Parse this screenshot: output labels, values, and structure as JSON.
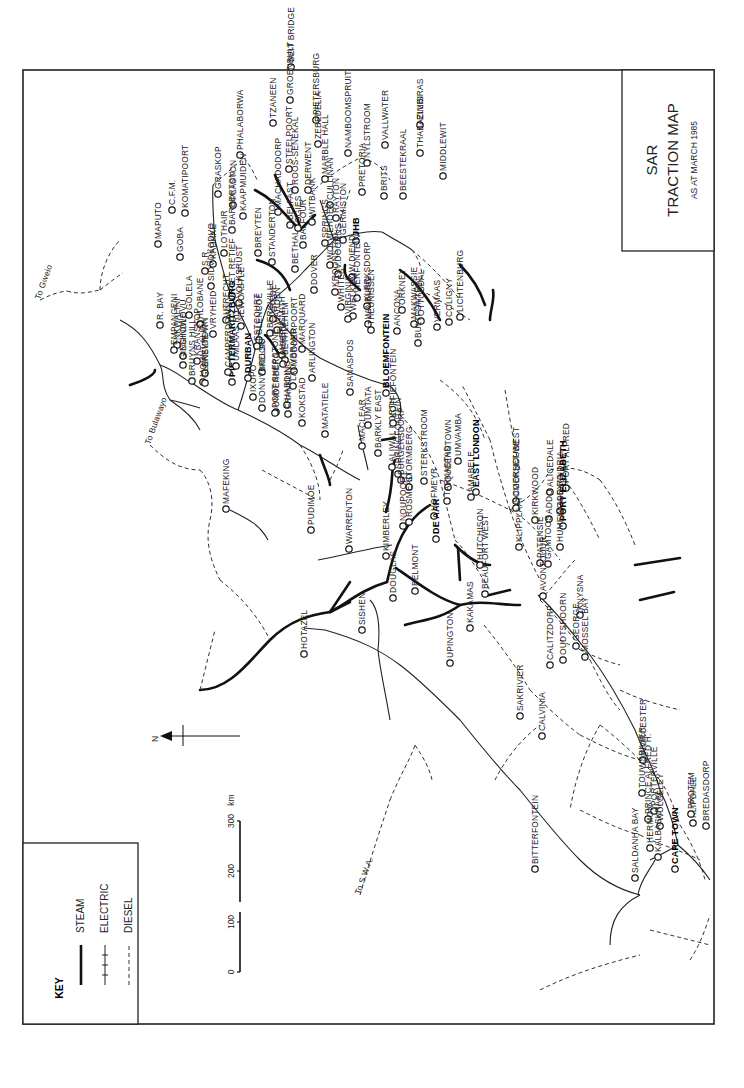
{
  "title": {
    "line1": "SAR",
    "line2": "TRACTION MAP",
    "line3": "AS AT MARCH 1985"
  },
  "key": {
    "heading": "KEY",
    "items": [
      {
        "type": "steam",
        "label": "STEAM"
      },
      {
        "type": "electric",
        "label": "ELECTRIC"
      },
      {
        "type": "diesel",
        "label": "DIESEL"
      }
    ]
  },
  "scale_bar": {
    "ticks": [
      "0",
      "100",
      "200",
      "300"
    ],
    "unit": "km"
  },
  "north_arrow": {
    "label": "N"
  },
  "external_links": [
    {
      "label": "To Gweio",
      "x": 40,
      "y": 300
    },
    {
      "label": "To Bulawayo",
      "x": 150,
      "y": 445
    },
    {
      "label": "To S.W.A.",
      "x": 360,
      "y": 895
    }
  ],
  "stations": [
    {
      "name": "BEIT BRIDGE",
      "x": 67,
      "y": 291
    },
    {
      "name": "GROENBULT",
      "x": 100,
      "y": 290
    },
    {
      "name": "TZANEEN",
      "x": 123,
      "y": 273
    },
    {
      "name": "PHALABORWA",
      "x": 155,
      "y": 240
    },
    {
      "name": "PIETERSBURG",
      "x": 120,
      "y": 316
    },
    {
      "name": "ZEBEDELIA",
      "x": 144,
      "y": 318
    },
    {
      "name": "NAMBOOMSPRUIT",
      "x": 153,
      "y": 348
    },
    {
      "name": "MARBLE HALL",
      "x": 179,
      "y": 325
    },
    {
      "name": "STEELPOORT",
      "x": 169,
      "y": 289
    },
    {
      "name": "ROOS-SENEKAL",
      "x": 190,
      "y": 295
    },
    {
      "name": "VALLWATER",
      "x": 145,
      "y": 385
    },
    {
      "name": "NYLSTROOM",
      "x": 163,
      "y": 367
    },
    {
      "name": "ELLISRAS",
      "x": 125,
      "y": 420
    },
    {
      "name": "THABAZIMBI",
      "x": 153,
      "y": 420
    },
    {
      "name": "MIDDLEWIT",
      "x": 176,
      "y": 443
    },
    {
      "name": "BEESTEKRAAL",
      "x": 196,
      "y": 403
    },
    {
      "name": "BRITS",
      "x": 196,
      "y": 384
    },
    {
      "name": "PRETORIA",
      "x": 192,
      "y": 362
    },
    {
      "name": "CULLINAN",
      "x": 205,
      "y": 330
    },
    {
      "name": "RAYTON",
      "x": 218,
      "y": 336
    },
    {
      "name": "WITBANK",
      "x": 222,
      "y": 312
    },
    {
      "name": "DERWENT",
      "x": 190,
      "y": 308
    },
    {
      "name": "BELFAST",
      "x": 225,
      "y": 290
    },
    {
      "name": "MACHADODORP",
      "x": 212,
      "y": 278
    },
    {
      "name": "GRASKOP",
      "x": 194,
      "y": 218
    },
    {
      "name": "PLASTON",
      "x": 205,
      "y": 233
    },
    {
      "name": "KAAPMUIDEN",
      "x": 216,
      "y": 243
    },
    {
      "name": "KOMATIPOORT",
      "x": 213,
      "y": 185
    },
    {
      "name": "C.F.M.",
      "x": 210,
      "y": 172
    },
    {
      "name": "BARBERTON",
      "x": 230,
      "y": 232
    },
    {
      "name": "MAPUTO",
      "x": 244,
      "y": 158
    },
    {
      "name": "GOBA",
      "x": 257,
      "y": 180
    },
    {
      "name": "LOTHAIR",
      "x": 253,
      "y": 224
    },
    {
      "name": "KADAKE",
      "x": 264,
      "y": 213
    },
    {
      "name": "S.R.",
      "x": 271,
      "y": 205
    },
    {
      "name": "SIDVOKODVO",
      "x": 286,
      "y": 211
    },
    {
      "name": "PIET RETIEF",
      "x": 296,
      "y": 232
    },
    {
      "name": "GOLELA",
      "x": 315,
      "y": 189
    },
    {
      "name": "BREYTEN",
      "x": 253,
      "y": 258
    },
    {
      "name": "BETHAL",
      "x": 269,
      "y": 295
    },
    {
      "name": "OGIES",
      "x": 228,
      "y": 298
    },
    {
      "name": "SPRINGS",
      "x": 243,
      "y": 325
    },
    {
      "name": "GERMISTON",
      "x": 240,
      "y": 343
    },
    {
      "name": "JHB",
      "x": 241,
      "y": 356
    },
    {
      "name": "BALFOUR",
      "x": 245,
      "y": 303
    },
    {
      "name": "STANDERTON",
      "x": 262,
      "y": 272
    },
    {
      "name": "VOLKSRUST",
      "x": 303,
      "y": 239
    },
    {
      "name": "UTRECHT",
      "x": 320,
      "y": 226
    },
    {
      "name": "HLOBANE",
      "x": 324,
      "y": 200
    },
    {
      "name": "VRYHEID",
      "x": 334,
      "y": 213
    },
    {
      "name": "NEWCASTLE",
      "x": 326,
      "y": 241
    },
    {
      "name": "GLENCOE",
      "x": 340,
      "y": 259
    },
    {
      "name": "VREDE",
      "x": 319,
      "y": 273
    },
    {
      "name": "WARDEN",
      "x": 330,
      "y": 277
    },
    {
      "name": "HARRISMITH",
      "x": 355,
      "y": 282
    },
    {
      "name": "BETHLEHEM",
      "x": 360,
      "y": 285
    },
    {
      "name": "ARLINGTON",
      "x": 378,
      "y": 312
    },
    {
      "name": "WOLWEHOEK",
      "x": 265,
      "y": 330
    },
    {
      "name": "V.DOORNS",
      "x": 274,
      "y": 338
    },
    {
      "name": "W.DIEND",
      "x": 277,
      "y": 352
    },
    {
      "name": "VIERFONTEIN",
      "x": 298,
      "y": 357
    },
    {
      "name": "KLERKSDORP",
      "x": 306,
      "y": 367
    },
    {
      "name": "DOVER",
      "x": 290,
      "y": 314
    },
    {
      "name": "KROONSTAD",
      "x": 292,
      "y": 335
    },
    {
      "name": "WHITES",
      "x": 307,
      "y": 341
    },
    {
      "name": "WELKOM",
      "x": 316,
      "y": 353
    },
    {
      "name": "VIRGINIA",
      "x": 319,
      "y": 348
    },
    {
      "name": "WINBURG",
      "x": 324,
      "y": 368
    },
    {
      "name": "THEUNISSEN",
      "x": 330,
      "y": 371
    },
    {
      "name": "ANCONA",
      "x": 331,
      "y": 397
    },
    {
      "name": "ORKNEY",
      "x": 310,
      "y": 402
    },
    {
      "name": "OTTOSDAL",
      "x": 321,
      "y": 421
    },
    {
      "name": "VERMAAS",
      "x": 327,
      "y": 437
    },
    {
      "name": "COLIGNY",
      "x": 322,
      "y": 449
    },
    {
      "name": "LICHTENBURG",
      "x": 317,
      "y": 460
    },
    {
      "name": "MAKWASSIE",
      "x": 324,
      "y": 414
    },
    {
      "name": "MARQUARD",
      "x": 349,
      "y": 302
    },
    {
      "name": "SANASPOS",
      "x": 392,
      "y": 350
    },
    {
      "name": "MODDERPOORT",
      "x": 371,
      "y": 294
    },
    {
      "name": "LADYBRAND",
      "x": 386,
      "y": 293
    },
    {
      "name": "MASERU",
      "x": 364,
      "y": 283
    },
    {
      "name": "BERGVILLE",
      "x": 333,
      "y": 270
    },
    {
      "name": "ESTCOURT",
      "x": 346,
      "y": 257
    },
    {
      "name": "MOUNT ALIDA",
      "x": 382,
      "y": 203
    },
    {
      "name": "GREYTOWN",
      "x": 373,
      "y": 205
    },
    {
      "name": "KRANSKOP",
      "x": 361,
      "y": 197
    },
    {
      "name": "ESHOWE",
      "x": 356,
      "y": 183
    },
    {
      "name": "NKWALINI",
      "x": 345,
      "y": 177
    },
    {
      "name": "R. BAY",
      "x": 325,
      "y": 160
    },
    {
      "name": "EMPANGENI",
      "x": 350,
      "y": 174
    },
    {
      "name": "GINGINDLOVU",
      "x": 365,
      "y": 183
    },
    {
      "name": "BRUYNS HILL",
      "x": 381,
      "y": 192
    },
    {
      "name": "GLENSIDE",
      "x": 383,
      "y": 205
    },
    {
      "name": "PIETERMARITZBURG",
      "x": 382,
      "y": 232
    },
    {
      "name": "CAMPERDOWN",
      "x": 372,
      "y": 228
    },
    {
      "name": "UMLAAS RD.",
      "x": 366,
      "y": 236
    },
    {
      "name": "DURBAN",
      "x": 378,
      "y": 248
    },
    {
      "name": "KELSO",
      "x": 372,
      "y": 262
    },
    {
      "name": "IXOPO",
      "x": 397,
      "y": 253
    },
    {
      "name": "DONNYBROOK",
      "x": 408,
      "y": 262
    },
    {
      "name": "UNDERBERG",
      "x": 412,
      "y": 276
    },
    {
      "name": "HARDING",
      "x": 405,
      "y": 287
    },
    {
      "name": "PORT SHEPSTONE",
      "x": 413,
      "y": 275
    },
    {
      "name": "FRANKLIN",
      "x": 414,
      "y": 288
    },
    {
      "name": "KOKSTAD",
      "x": 423,
      "y": 302
    },
    {
      "name": "MATATIELE",
      "x": 434,
      "y": 325
    },
    {
      "name": "UMTATA",
      "x": 425,
      "y": 368
    },
    {
      "name": "MACLEAR",
      "x": 446,
      "y": 362
    },
    {
      "name": "BARKLY EAST",
      "x": 453,
      "y": 378
    },
    {
      "name": "ALIWAL NORTH",
      "x": 467,
      "y": 392
    },
    {
      "name": "SPRINGFONTEIN",
      "x": 474,
      "y": 398
    },
    {
      "name": "BLOEMFONTEIN",
      "x": 393,
      "y": 386
    },
    {
      "name": "KOFFIEFONTEIN",
      "x": 423,
      "y": 393
    },
    {
      "name": "BULTFONTEIN",
      "x": 343,
      "y": 418
    },
    {
      "name": "BURGERSDORP",
      "x": 480,
      "y": 401
    },
    {
      "name": "STORMBERG",
      "x": 487,
      "y": 409
    },
    {
      "name": "STERKSTROOM",
      "x": 481,
      "y": 424
    },
    {
      "name": "QUEENSTOWN",
      "x": 487,
      "y": 448
    },
    {
      "name": "UMVAMBA",
      "x": 461,
      "y": 458
    },
    {
      "name": "AMABELE",
      "x": 497,
      "y": 471
    },
    {
      "name": "EAST LONDON",
      "x": 492,
      "y": 476
    },
    {
      "name": "TARKASTAD",
      "x": 501,
      "y": 447
    },
    {
      "name": "HOFMEYR",
      "x": 516,
      "y": 434
    },
    {
      "name": "NOUPOORT",
      "x": 526,
      "y": 403
    },
    {
      "name": "ROSMEAD",
      "x": 522,
      "y": 409
    },
    {
      "name": "DE AAR",
      "x": 539,
      "y": 436
    },
    {
      "name": "COOKHOUSE",
      "x": 501,
      "y": 516
    },
    {
      "name": "SOMERSET WEST",
      "x": 508,
      "y": 516
    },
    {
      "name": "ALICEDALE",
      "x": 492,
      "y": 550
    },
    {
      "name": "PORT ALFRED",
      "x": 488,
      "y": 566
    },
    {
      "name": "KIRKWOOD",
      "x": 520,
      "y": 535
    },
    {
      "name": "ADDO",
      "x": 519,
      "y": 549
    },
    {
      "name": "ALEXANDRIA",
      "x": 511,
      "y": 560
    },
    {
      "name": "PORT ELIZABETH",
      "x": 526,
      "y": 563
    },
    {
      "name": "PATENSIE",
      "x": 563,
      "y": 540
    },
    {
      "name": "GAMTOOS",
      "x": 564,
      "y": 548
    },
    {
      "name": "HUMEWOOD RD",
      "x": 547,
      "y": 560
    },
    {
      "name": "KLIPPLAAT",
      "x": 547,
      "y": 519
    },
    {
      "name": "AVONTOUUR",
      "x": 596,
      "y": 543
    },
    {
      "name": "KNYSNA",
      "x": 615,
      "y": 580
    },
    {
      "name": "GEORGE",
      "x": 646,
      "y": 576
    },
    {
      "name": "MOSSEL BAY",
      "x": 657,
      "y": 585
    },
    {
      "name": "OUDTSHOORN",
      "x": 660,
      "y": 563
    },
    {
      "name": "CALITZDORP",
      "x": 665,
      "y": 550
    },
    {
      "name": "BEAUFORT WEST",
      "x": 594,
      "y": 485
    },
    {
      "name": "HUTCHISON",
      "x": 565,
      "y": 480
    },
    {
      "name": "KIMBERLEY",
      "x": 556,
      "y": 386
    },
    {
      "name": "WARRENTON",
      "x": 549,
      "y": 349
    },
    {
      "name": "PUDIMOE",
      "x": 530,
      "y": 311
    },
    {
      "name": "MAFEKING",
      "x": 509,
      "y": 226
    },
    {
      "name": "BELMONT",
      "x": 591,
      "y": 415
    },
    {
      "name": "DOUGLAS",
      "x": 598,
      "y": 393
    },
    {
      "name": "SISHEN",
      "x": 630,
      "y": 362
    },
    {
      "name": "HOTAZEL",
      "x": 654,
      "y": 304
    },
    {
      "name": "UPINGTON",
      "x": 663,
      "y": 450
    },
    {
      "name": "KAKAMAS",
      "x": 628,
      "y": 470
    },
    {
      "name": "SAKRIVIER",
      "x": 716,
      "y": 520
    },
    {
      "name": "CALVINIA",
      "x": 736,
      "y": 542
    },
    {
      "name": "BITTERFONTEIN",
      "x": 869,
      "y": 535
    },
    {
      "name": "WORCESTER",
      "x": 760,
      "y": 643
    },
    {
      "name": "TOUWSRIVIER",
      "x": 793,
      "y": 642
    },
    {
      "name": "PRINCE ALFRED H.",
      "x": 819,
      "y": 648
    },
    {
      "name": "PORTERVILLE",
      "x": 811,
      "y": 654
    },
    {
      "name": "WOLSELEY",
      "x": 826,
      "y": 660
    },
    {
      "name": "HERMON",
      "x": 848,
      "y": 650
    },
    {
      "name": "KALBASKRAAL",
      "x": 857,
      "y": 658
    },
    {
      "name": "CAPE TOWN",
      "x": 869,
      "y": 675
    },
    {
      "name": "SALDANHA BAY",
      "x": 878,
      "y": 635
    },
    {
      "name": "KLIPDALE",
      "x": 823,
      "y": 693
    },
    {
      "name": "PROTEM",
      "x": 814,
      "y": 691
    },
    {
      "name": "BREDASDORP",
      "x": 826,
      "y": 706
    }
  ]
}
